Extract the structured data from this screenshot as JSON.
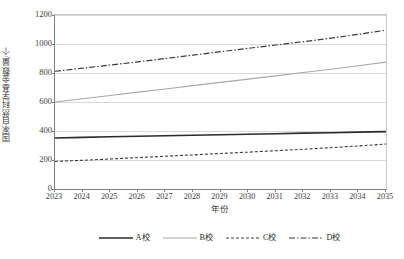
{
  "chart_data": {
    "type": "line",
    "title": "",
    "xlabel": "年份",
    "ylabel": "国家自然科学基金数量/个",
    "x": [
      2023,
      2024,
      2025,
      2026,
      2027,
      2028,
      2029,
      2030,
      2031,
      2032,
      2033,
      2034,
      2035
    ],
    "xtick_labels": [
      "2023",
      "2024",
      "2025",
      "2026",
      "2027",
      "2028",
      "2029",
      "2030",
      "2031",
      "2032",
      "2033",
      "2034",
      "2035"
    ],
    "ytick_labels": [
      "0",
      "200",
      "400",
      "600",
      "800",
      "1000",
      "1200"
    ],
    "yticks": [
      0,
      200,
      400,
      600,
      800,
      1000,
      1200
    ],
    "ylim": [
      0,
      1200
    ],
    "xlim": [
      2023,
      2035
    ],
    "grid": "horizontal",
    "legend_position": "bottom",
    "series": [
      {
        "name": "A校",
        "style": "solid",
        "color": "#2b2b2b",
        "width": 1.6,
        "values": [
          352,
          356,
          360,
          364,
          367,
          371,
          374,
          378,
          381,
          385,
          388,
          392,
          396
        ]
      },
      {
        "name": "B校",
        "style": "solid",
        "color": "#a8a8a8",
        "width": 1.1,
        "values": [
          600,
          622,
          645,
          668,
          690,
          713,
          735,
          758,
          780,
          803,
          826,
          850,
          875
        ]
      },
      {
        "name": "C校",
        "style": "dashed-short",
        "color": "#3a3a3a",
        "width": 1.1,
        "values": [
          190,
          198,
          207,
          216,
          226,
          235,
          245,
          254,
          264,
          274,
          285,
          297,
          310
        ]
      },
      {
        "name": "D校",
        "style": "dash-dot",
        "color": "#3a3a3a",
        "width": 1.2,
        "values": [
          812,
          833,
          855,
          877,
          900,
          923,
          947,
          970,
          993,
          1016,
          1040,
          1067,
          1095
        ]
      }
    ]
  },
  "axes": {
    "y_title": "国家自然科学基金数量/个",
    "x_title": "年份"
  },
  "legend": {
    "items": [
      {
        "label": "A校"
      },
      {
        "label": "B校"
      },
      {
        "label": "C校"
      },
      {
        "label": "D校"
      }
    ]
  }
}
